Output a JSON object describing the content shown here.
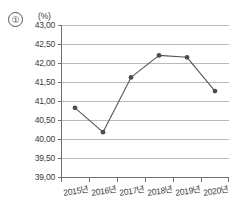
{
  "item_number": "①",
  "chart_data": {
    "type": "line",
    "title": "",
    "subtitle": "",
    "xlabel": "",
    "ylabel": "",
    "unit_label": "(%)",
    "categories": [
      "2015년",
      "2016년",
      "2017년",
      "2018년",
      "2019년",
      "2020년"
    ],
    "values": [
      40.82,
      40.18,
      41.62,
      42.2,
      42.15,
      41.26
    ],
    "series": [
      {
        "name": "",
        "values": [
          40.82,
          40.18,
          41.62,
          42.2,
          42.15,
          41.26
        ]
      }
    ],
    "ylim": [
      39.0,
      43.0
    ],
    "ytick_step": 0.5,
    "ytick_labels": [
      "43,00",
      "42,50",
      "42,00",
      "41,50",
      "41,00",
      "40,50",
      "40,00",
      "39,50",
      "39,00"
    ],
    "ytick_values": [
      43.0,
      42.5,
      42.0,
      41.5,
      41.0,
      40.5,
      40.0,
      39.5,
      39.0
    ],
    "grid": true,
    "legend": "none",
    "marker": "circle",
    "line_color": "#555555",
    "marker_color": "#4d4d4d",
    "grid_color": "#b9b9b9",
    "axis_color": "#6f6f6f"
  }
}
